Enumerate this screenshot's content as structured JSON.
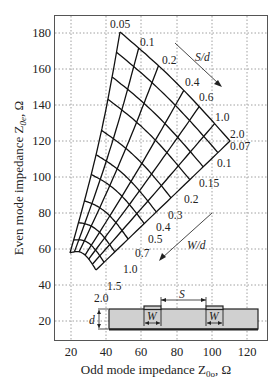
{
  "chart_data": {
    "type": "nomogram",
    "title": "",
    "xlabel": "Odd mode impedance Z0o, Ω",
    "ylabel": "Even mode impedance Z0e, Ω",
    "xlim": [
      10,
      130
    ],
    "ylim": [
      10,
      190
    ],
    "x_ticks": [
      20,
      40,
      60,
      80,
      100,
      120
    ],
    "y_ticks": [
      20,
      40,
      60,
      80,
      100,
      120,
      140,
      160,
      180
    ],
    "grid": "dotted",
    "families": [
      {
        "parameter": "S/d",
        "values": [
          0.05,
          0.1,
          0.2,
          0.4,
          0.6,
          1.0,
          2.0
        ],
        "direction_arrow": "S/d increasing toward lower-right"
      },
      {
        "parameter": "W/d",
        "values": [
          0.07,
          0.1,
          0.15,
          0.2,
          0.3,
          0.4,
          0.5,
          0.7,
          1.0,
          1.5,
          2.0
        ],
        "direction_arrow": "W/d increasing toward lower-left"
      }
    ],
    "corner_points": [
      {
        "S/d": 0.05,
        "W/d": 0.07,
        "Z0o": 47,
        "Z0e": 180
      },
      {
        "S/d": 2.0,
        "W/d": 0.07,
        "Z0o": 109,
        "Z0e": 119
      },
      {
        "S/d": 0.05,
        "W/d": 2.0,
        "Z0o": 19,
        "Z0e": 41
      },
      {
        "S/d": 2.0,
        "W/d": 2.0,
        "Z0o": 33,
        "Z0e": 32
      }
    ],
    "inset": {
      "description": "Coupled microstrip cross-section",
      "labels": [
        "S",
        "W",
        "W",
        "d"
      ]
    }
  },
  "labels": {
    "xlabel_text": "Odd mode impedance Z",
    "xlabel_sub": "0o",
    "xlabel_unit": ", Ω",
    "ylabel_text": "Even mode impedance Z",
    "ylabel_sub": "0e",
    "ylabel_unit": ", Ω",
    "sd_arrow": "S/d",
    "wd_arrow": "W/d",
    "inset_s": "S",
    "inset_w1": "W",
    "inset_w2": "W",
    "inset_d": "d"
  },
  "ticks": {
    "x": [
      "20",
      "40",
      "60",
      "80",
      "100",
      "120"
    ],
    "y": [
      "20",
      "40",
      "60",
      "80",
      "100",
      "120",
      "140",
      "160",
      "180"
    ]
  },
  "sd_labels": [
    "0.05",
    "0.1",
    "0.2",
    "0.4",
    "0.6",
    "1.0",
    "2.0"
  ],
  "wd_labels": [
    "0.07",
    "0.1",
    "0.15",
    "0.2",
    "0.3",
    "0.4",
    "0.5",
    "0.7",
    "1.0",
    "1.5",
    "2.0"
  ]
}
